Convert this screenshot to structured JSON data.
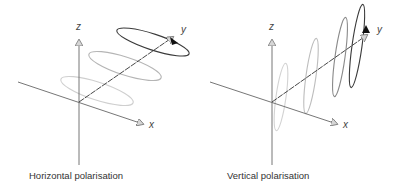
{
  "panels": [
    {
      "id": "horizontal",
      "caption": "Horizontal polarisation",
      "axes": {
        "x_label": "x",
        "y_label": "y",
        "z_label": "z"
      },
      "wave": {
        "orientation": "horizontal",
        "loops": 3,
        "colors": [
          "#c8c8c8",
          "#8a8a8a",
          "#3a3a3a"
        ]
      }
    },
    {
      "id": "vertical",
      "caption": "Vertical polarisation",
      "axes": {
        "x_label": "x",
        "y_label": "y",
        "z_label": "z"
      },
      "wave": {
        "orientation": "vertical",
        "loops": 4,
        "colors": [
          "#d0d0d0",
          "#a8a8a8",
          "#7a7a7a",
          "#3a3a3a"
        ]
      }
    }
  ],
  "colors": {
    "axis": "#555555",
    "arrow_fill": "#cccccc",
    "arrow_dark": "#111111"
  }
}
